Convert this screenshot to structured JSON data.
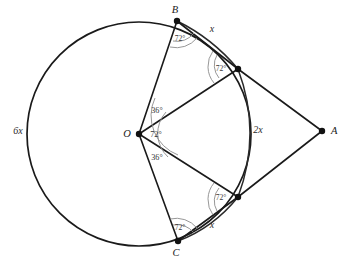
{
  "figure": {
    "type": "geometry-diagram",
    "background_color": "#ffffff",
    "stroke_color": "#1a1a1a",
    "angle_arc_color": "#8b8b8b",
    "width": 346,
    "height": 264
  },
  "circle": {
    "center_label": "O",
    "center_x": 139,
    "center_y": 134,
    "radius": 112
  },
  "points": [
    {
      "id": "B",
      "label": "B",
      "x": 177,
      "y": 21,
      "label_x": 175,
      "label_y": 13,
      "on_circle": true
    },
    {
      "id": "D",
      "label": "",
      "x": 238,
      "y": 69,
      "label_x": 238,
      "label_y": 69,
      "on_circle": true
    },
    {
      "id": "A",
      "label": "A",
      "x": 322,
      "y": 131,
      "label_x": 331,
      "label_y": 134,
      "on_circle": false
    },
    {
      "id": "E",
      "label": "",
      "x": 238,
      "y": 197,
      "label_x": 238,
      "label_y": 197,
      "on_circle": true
    },
    {
      "id": "C",
      "label": "C",
      "x": 178,
      "y": 241,
      "label_x": 176,
      "label_y": 256,
      "on_circle": true
    },
    {
      "id": "O",
      "label": "O",
      "x": 139,
      "y": 134,
      "label_x": 127,
      "label_y": 137,
      "on_circle": false
    }
  ],
  "arc_labels": [
    {
      "id": "arc-6x",
      "text": "6x",
      "x": 18,
      "y": 134
    },
    {
      "id": "arc-x-top",
      "text": "x",
      "x": 212,
      "y": 32
    },
    {
      "id": "arc-2x",
      "text": "2x",
      "x": 258,
      "y": 133
    },
    {
      "id": "arc-x-bottom",
      "text": "x",
      "x": 212,
      "y": 228
    }
  ],
  "angle_labels": [
    {
      "id": "angle-at-B",
      "text": "72°",
      "x": 180,
      "y": 41,
      "vertex": "B"
    },
    {
      "id": "angle-at-D",
      "text": "72°",
      "x": 219,
      "y": 70,
      "vertex": "D"
    },
    {
      "id": "angle-O-upper",
      "text": "36°",
      "x": 157,
      "y": 113,
      "vertex": "O"
    },
    {
      "id": "angle-O-middle",
      "text": "72°",
      "x": 155,
      "y": 136,
      "vertex": "O"
    },
    {
      "id": "angle-O-lower",
      "text": "36°",
      "x": 157,
      "y": 159,
      "vertex": "O"
    },
    {
      "id": "angle-at-E",
      "text": "72°",
      "x": 219,
      "y": 198,
      "vertex": "E"
    },
    {
      "id": "angle-at-C",
      "text": "72°",
      "x": 180,
      "y": 227,
      "vertex": "C"
    }
  ],
  "segments": [
    {
      "id": "segment-O-B",
      "from": "O",
      "to": "B"
    },
    {
      "id": "segment-O-C",
      "from": "O",
      "to": "C"
    },
    {
      "id": "segment-O-D",
      "from": "O",
      "to": "D"
    },
    {
      "id": "segment-O-E",
      "from": "O",
      "to": "E"
    },
    {
      "id": "segment-B-D",
      "from": "B",
      "to": "D"
    },
    {
      "id": "segment-C-E",
      "from": "C",
      "to": "E"
    },
    {
      "id": "segment-D-A",
      "from": "D",
      "to": "A"
    },
    {
      "id": "segment-E-A",
      "from": "E",
      "to": "A"
    }
  ]
}
